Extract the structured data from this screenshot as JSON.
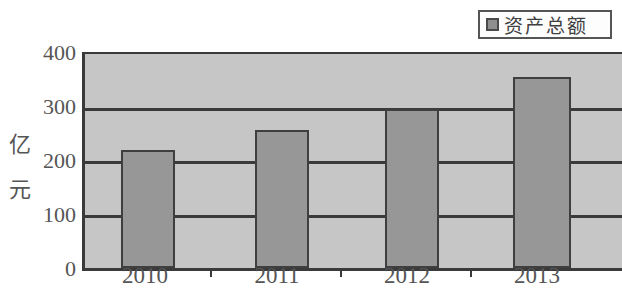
{
  "chart_data": {
    "type": "bar",
    "title": "",
    "subtitle": "",
    "xlabel": "",
    "ylabel": "亿元",
    "categories": [
      "2010",
      "2011",
      "2012",
      "2013"
    ],
    "series": [
      {
        "name": "资产总额",
        "values": [
          220,
          258,
          297,
          357
        ],
        "color": "#979797"
      }
    ],
    "ylim": [
      0,
      400
    ],
    "ytick_labels": [
      "0",
      "100",
      "200",
      "300",
      "400"
    ],
    "ytick_values": [
      0,
      100,
      200,
      300,
      400
    ],
    "grid": true,
    "legend": {
      "position": "top-right",
      "entries": [
        {
          "label": "资产总额",
          "swatch_color": "#8f8f8f"
        }
      ]
    },
    "plot_background": "#c6c6c6",
    "axis_color": "#3a3a3a",
    "note_clipped_right": true
  }
}
